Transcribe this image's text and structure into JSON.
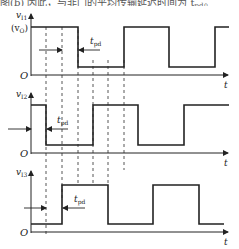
{
  "caption_fragment": {
    "text": "图(b)  因此，与非门的平均传输延迟时间为 t",
    "suffix_subscript": "pd",
    "suffix_tail": "。"
  },
  "diagram": {
    "type": "timing-diagram",
    "time_axis_label": "t",
    "origin_label": "O",
    "dashed_guides_x": [
      46,
      62,
      78,
      93,
      108,
      124
    ],
    "plots": [
      {
        "id": "v11",
        "y_label": "v",
        "y_label_sub": "I1",
        "level_label": "(v",
        "level_label_sub": "O",
        "level_label_tail": ")",
        "delay_label": "t",
        "delay_label_sub": "pd",
        "transitions": [
          "high",
          "fall@78",
          "rise@124",
          "fall@169",
          "rise@215"
        ]
      },
      {
        "id": "v12",
        "y_label": "v",
        "y_label_sub": "I2",
        "delay_label": "t",
        "delay_label_sub": "pd",
        "transitions": [
          "high",
          "fall@46",
          "rise@93",
          "fall@138",
          "rise@184"
        ]
      },
      {
        "id": "v13",
        "y_label": "v",
        "y_label_sub": "I3",
        "delay_label": "t",
        "delay_label_sub": "pd",
        "transitions": [
          "low",
          "rise@62",
          "fall@108",
          "rise@153",
          "fall@199"
        ]
      }
    ]
  },
  "colors": {
    "line": "#222222",
    "dash": "#444444",
    "background": "#ffffff"
  }
}
